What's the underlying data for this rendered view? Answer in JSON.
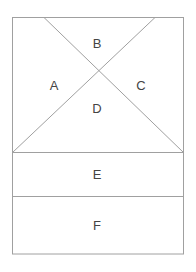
{
  "diagram": {
    "type": "region-partition",
    "stroke_color": "#a0a0a0",
    "label_color": "#444444",
    "outer_rect": {
      "x1": 12,
      "y1": 17,
      "x2": 184,
      "y2": 254
    },
    "diagonals": [
      {
        "name": "diagonal-left-to-right",
        "x1": 44,
        "y1": 17,
        "x2": 184,
        "y2": 152
      },
      {
        "name": "diagonal-right-to-left",
        "x1": 155,
        "y1": 17,
        "x2": 12,
        "y2": 152
      }
    ],
    "dividers": [
      {
        "name": "divider-de",
        "y": 152
      },
      {
        "name": "divider-ef",
        "y": 196
      }
    ],
    "regions": [
      {
        "id": "A",
        "label": "A",
        "x": 54,
        "y": 85
      },
      {
        "id": "B",
        "label": "B",
        "x": 97,
        "y": 43
      },
      {
        "id": "C",
        "label": "C",
        "x": 141,
        "y": 85
      },
      {
        "id": "D",
        "label": "D",
        "x": 97,
        "y": 108
      },
      {
        "id": "E",
        "label": "E",
        "x": 97,
        "y": 174
      },
      {
        "id": "F",
        "label": "F",
        "x": 97,
        "y": 225
      }
    ]
  }
}
